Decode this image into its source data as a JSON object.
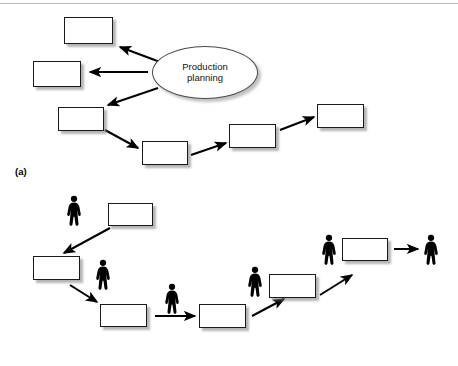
{
  "figure": {
    "width": 458,
    "height": 366,
    "background_color": "#ffffff",
    "rule_color": "#b9b9b9",
    "box_fill": "#ffffff",
    "box_border_color": "#1a1a1a",
    "shadow_color": "#808080",
    "arrow_color": "#000000",
    "person_color": "#000000"
  },
  "panels": [
    {
      "id": "a",
      "label": "(a)",
      "label_x": 15,
      "label_y": 166,
      "ellipse": {
        "name": "production-planning-ellipse",
        "text_line1": "Production",
        "text_line2": "planning",
        "x": 152,
        "y": 46,
        "w": 106,
        "h": 53
      },
      "boxes": [
        {
          "name": "process-box-a1",
          "label": "",
          "x": 64,
          "y": 17,
          "w": 49,
          "h": 27
        },
        {
          "name": "process-box-a2",
          "label": "",
          "x": 33,
          "y": 61,
          "w": 48,
          "h": 26
        },
        {
          "name": "process-box-a3",
          "label": "",
          "x": 58,
          "y": 107,
          "w": 46,
          "h": 24
        },
        {
          "name": "process-box-a4",
          "label": "",
          "x": 142,
          "y": 141,
          "w": 46,
          "h": 24
        },
        {
          "name": "process-box-a5",
          "label": "",
          "x": 229,
          "y": 124,
          "w": 47,
          "h": 24
        },
        {
          "name": "process-box-a6",
          "label": "",
          "x": 317,
          "y": 104,
          "w": 47,
          "h": 24
        }
      ],
      "arrows": [
        {
          "name": "arrow-planning-to-a1",
          "x1": 160,
          "y1": 62,
          "x2": 120,
          "y2": 47
        },
        {
          "name": "arrow-planning-to-a2",
          "x1": 148,
          "y1": 72,
          "x2": 90,
          "y2": 72
        },
        {
          "name": "arrow-planning-to-a3",
          "x1": 158,
          "y1": 88,
          "x2": 108,
          "y2": 105
        },
        {
          "name": "arrow-a3-to-a4",
          "x1": 105,
          "y1": 130,
          "x2": 138,
          "y2": 148
        },
        {
          "name": "arrow-a4-to-a5",
          "x1": 191,
          "y1": 155,
          "x2": 226,
          "y2": 143
        },
        {
          "name": "arrow-a5-to-a6",
          "x1": 280,
          "y1": 130,
          "x2": 314,
          "y2": 117
        }
      ]
    },
    {
      "id": "b",
      "label": "(b)",
      "label_x": 15,
      "label_y": 334,
      "boxes": [
        {
          "name": "process-box-b1",
          "label": "",
          "x": 108,
          "y": 203,
          "w": 45,
          "h": 23
        },
        {
          "name": "process-box-b2",
          "label": "",
          "x": 33,
          "y": 256,
          "w": 47,
          "h": 24
        },
        {
          "name": "process-box-b3",
          "label": "",
          "x": 100,
          "y": 304,
          "w": 47,
          "h": 23
        },
        {
          "name": "process-box-b4",
          "label": "",
          "x": 199,
          "y": 304,
          "w": 47,
          "h": 24
        },
        {
          "name": "process-box-b5",
          "label": "",
          "x": 269,
          "y": 274,
          "w": 47,
          "h": 24
        },
        {
          "name": "process-box-b6",
          "label": "",
          "x": 342,
          "y": 238,
          "w": 46,
          "h": 23
        }
      ],
      "people": [
        {
          "name": "worker-icon-b1",
          "x": 65,
          "y": 195,
          "w": 18,
          "h": 31
        },
        {
          "name": "worker-icon-b2",
          "x": 94,
          "y": 259,
          "w": 18,
          "h": 31
        },
        {
          "name": "worker-icon-b3",
          "x": 163,
          "y": 283,
          "w": 18,
          "h": 31
        },
        {
          "name": "worker-icon-b4",
          "x": 246,
          "y": 266,
          "w": 18,
          "h": 31
        },
        {
          "name": "worker-icon-b5",
          "x": 320,
          "y": 234,
          "w": 18,
          "h": 31
        },
        {
          "name": "worker-icon-b6",
          "x": 422,
          "y": 234,
          "w": 18,
          "h": 31
        }
      ],
      "arrows": [
        {
          "name": "arrow-b1-to-b2",
          "x1": 110,
          "y1": 228,
          "x2": 64,
          "y2": 253
        },
        {
          "name": "arrow-b2-to-b3",
          "x1": 70,
          "y1": 285,
          "x2": 97,
          "y2": 302
        },
        {
          "name": "arrow-b3-to-b4",
          "x1": 155,
          "y1": 316,
          "x2": 195,
          "y2": 316
        },
        {
          "name": "arrow-b4-to-b5",
          "x1": 252,
          "y1": 316,
          "x2": 284,
          "y2": 299
        },
        {
          "name": "arrow-b5-to-b6",
          "x1": 320,
          "y1": 295,
          "x2": 352,
          "y2": 275
        },
        {
          "name": "arrow-b6-to-worker",
          "x1": 394,
          "y1": 249,
          "x2": 418,
          "y2": 249
        }
      ]
    }
  ]
}
